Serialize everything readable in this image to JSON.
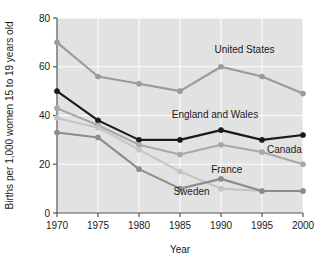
{
  "chart_data": {
    "type": "line",
    "title": "",
    "xlabel": "Year",
    "ylabel": "Births per 1,000 women 15 to 19 years old",
    "x": [
      1970,
      1975,
      1980,
      1985,
      1990,
      1995,
      2000
    ],
    "xticklabels": [
      "1970",
      "1975",
      "1980",
      "1985",
      "1990",
      "1995",
      "2000"
    ],
    "yticklabels": [
      "0",
      "20",
      "40",
      "60",
      "80"
    ],
    "yticks": [
      0,
      20,
      40,
      60,
      80
    ],
    "xlim": [
      1970,
      2000
    ],
    "ylim": [
      0,
      80
    ],
    "grid": true,
    "grid_color": "#ffffff",
    "plot_background": "#e2e2e2",
    "legend_position": "inline-annotations",
    "markers": true,
    "series": [
      {
        "name": "United States",
        "color": "#9a9a9a",
        "values": [
          70,
          56,
          53,
          50,
          60,
          56,
          49
        ],
        "label_x": 1989.2,
        "label_y": 65.5,
        "label_anchor": "start"
      },
      {
        "name": "England and Wales",
        "color": "#1a1a1a",
        "values": [
          50,
          38,
          30,
          30,
          34,
          30,
          32
        ],
        "label_x": 1984.0,
        "label_y": 39.0,
        "label_anchor": "start"
      },
      {
        "name": "Canada",
        "color": "#a8a8a8",
        "values": [
          43,
          36,
          28,
          24,
          28,
          25,
          20
        ],
        "label_x": 1995.6,
        "label_y": 24.5,
        "label_anchor": "start"
      },
      {
        "name": "France",
        "color": "#c4c4c4",
        "values": [
          39,
          35,
          26,
          17,
          10,
          9,
          9
        ],
        "label_x": 1988.8,
        "label_y": 16.5,
        "label_anchor": "start"
      },
      {
        "name": "Sweden",
        "color": "#8c8c8c",
        "values": [
          33,
          31,
          18,
          10,
          14,
          9,
          9
        ],
        "label_x": 1984.2,
        "label_y": 7.5,
        "label_anchor": "start"
      }
    ]
  },
  "axes": {
    "x_title": "Year",
    "y_title": "Births per 1,000 women 15 to 19 years old"
  }
}
